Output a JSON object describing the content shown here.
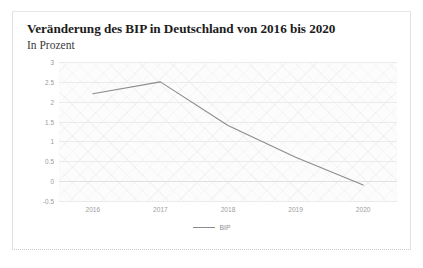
{
  "card": {
    "title": "Veränderung des BIP in Deutschland von 2016 bis 2020",
    "subtitle": "In Prozent"
  },
  "chart_data": {
    "type": "line",
    "title": "Veränderung des BIP in Deutschland von 2016 bis 2020",
    "subtitle": "In Prozent",
    "xlabel": "",
    "ylabel": "",
    "unit": "Prozent",
    "categories": [
      "2016",
      "2017",
      "2018",
      "2019",
      "2020"
    ],
    "series": [
      {
        "name": "BIP",
        "values": [
          2.2,
          2.5,
          1.4,
          0.6,
          -0.1
        ],
        "color": "#8c8c8c"
      }
    ],
    "yticks": [
      "3",
      "2.5",
      "2",
      "1.5",
      "1",
      "0.5",
      "0",
      "-0.5"
    ],
    "ytick_values": [
      3,
      2.5,
      2,
      1.5,
      1,
      0.5,
      0,
      -0.5
    ],
    "ylim": [
      -0.5,
      3
    ],
    "grid": true,
    "legend_position": "bottom",
    "legend": [
      "BIP"
    ],
    "line_color": "#8c8c8c"
  }
}
